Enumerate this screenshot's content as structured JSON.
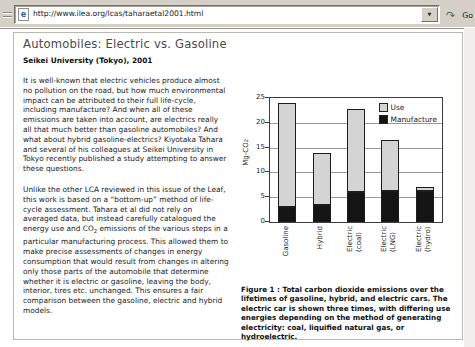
{
  "browser": {
    "url": "http://www.ilea.org/lcas/taharaetal2001.html",
    "go_label": "Go"
  },
  "article": {
    "title": "Automobiles: Electric vs. Gasoline",
    "subtitle": "Seikei University (Tokyo), 2001",
    "paragraph1": "It is well-known that electric vehicles produce almost no pollution on the road, but how much environmental impact can be attributed to their full life-cycle, including manufacture? And when all of these emissions are taken into account, are electrics really all that much better than gasoline automobiles? And what about hybrid gasoline-electrics? Kiyotaka Tahara and several of his colleagues at Seikei University in Tokyo recently published a study attempting to answer these questions.",
    "paragraph2_pre": "Unlike the other LCA reviewed in this issue of the Leaf, this work is based on a “bottom-up” method of life-cycle assessment. Tahara et al did not rely on averaged data, but instead carefully catalogued the energy use and CO",
    "paragraph2_sub": "2",
    "paragraph2_post": " emissions of the various steps in a particular manufacturing process. This allowed them to make precise assessments of changes in energy consumption that would result from changes in altering only those parts of the automobile that determine whether it is electric or gasoline, leaving the body, interior, tires etc. unchanged. This ensures a fair comparison between the gasoline, electric and hybrid models."
  },
  "figure": {
    "caption": "Figure 1 : Total carbon dioxide emissions over the lifetimes of gasoline, hybrid, and electric cars. The electric car is shown three times, with differing use energies depending on the method of generating electricity: coal, liquified natural gas, or hydroelectric."
  },
  "chart_data": {
    "type": "bar",
    "stacked": true,
    "categories": [
      "Gasoline",
      "Hybrid",
      "Electric (coal)",
      "Electric (LNG)",
      "Electric (hydro)"
    ],
    "series": [
      {
        "name": "Use",
        "color": "#d4d4d4",
        "values": [
          21,
          10.5,
          16.8,
          10.2,
          0.8
        ]
      },
      {
        "name": "Manufacture",
        "color": "#141414",
        "values": [
          3,
          3.5,
          6,
          6.3,
          6.3
        ]
      }
    ],
    "title": "",
    "xlabel": "",
    "ylabel": "Mg-CO2",
    "ylim": [
      0,
      25
    ],
    "yticks": [
      0,
      5,
      10,
      15,
      20,
      25
    ],
    "grid": true,
    "legend_position": "top-right"
  }
}
